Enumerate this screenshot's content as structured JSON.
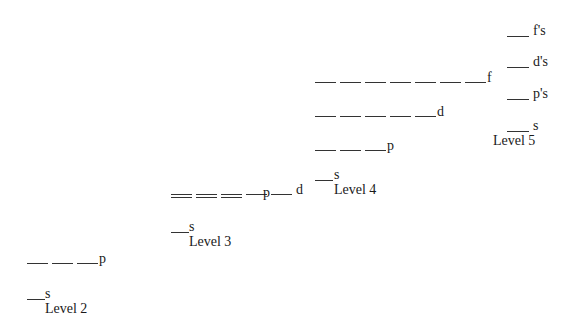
{
  "diagram": {
    "levels": [
      {
        "name": "Level 2",
        "sublevels": [
          {
            "label": "s",
            "orbitals": 1
          },
          {
            "label": "p",
            "orbitals": 3
          }
        ]
      },
      {
        "name": "Level 3",
        "sublevels": [
          {
            "label": "s",
            "orbitals": 1
          },
          {
            "label": "p",
            "orbitals": 3
          },
          {
            "label": "d",
            "orbitals": 5
          }
        ]
      },
      {
        "name": "Level 4",
        "sublevels": [
          {
            "label": "s",
            "orbitals": 1
          },
          {
            "label": "p",
            "orbitals": 3
          },
          {
            "label": "d",
            "orbitals": 5
          },
          {
            "label": "f",
            "orbitals": 7
          }
        ]
      },
      {
        "name": "Level 5",
        "sublevels": [
          {
            "label": "s",
            "orbitals": 1
          },
          {
            "label": "p's",
            "orbitals": 1
          },
          {
            "label": "d's",
            "orbitals": 1
          },
          {
            "label": "f's",
            "orbitals": 1
          }
        ]
      }
    ]
  }
}
